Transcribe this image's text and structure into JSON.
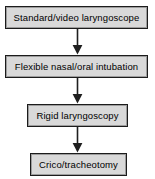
{
  "diagram": {
    "background_color": "#ffffff",
    "box_fill_color": "#d9d9d9",
    "box_border_color": "#1c1c1c",
    "arrow_color": "#1f1f1f",
    "text_color": "#000000",
    "nodes": [
      {
        "id": "node-1",
        "label": "Standard/video laryngoscope",
        "order": "1",
        "x": 5,
        "y": 6,
        "width": 143,
        "height": 23
      },
      {
        "id": "node-2",
        "label": "Flexible nasal/oral intubation",
        "order": "2",
        "x": 5,
        "y": 55,
        "width": 143,
        "height": 23
      },
      {
        "id": "node-3",
        "label": "Rigid laryngoscopy",
        "order": "3",
        "x": 27,
        "y": 104,
        "width": 101,
        "height": 23
      },
      {
        "id": "node-4",
        "label": "Crico/tracheotomy",
        "order": "4",
        "x": 30,
        "y": 153,
        "width": 97,
        "height": 23
      }
    ],
    "connectors": [
      {
        "id": "arrow-1",
        "from": "node-1",
        "to": "node-2",
        "direction": "down",
        "x": 71,
        "y": 29,
        "height": 26
      },
      {
        "id": "arrow-2",
        "from": "node-2",
        "to": "node-3",
        "direction": "down",
        "x": 71,
        "y": 78,
        "height": 26
      },
      {
        "id": "arrow-3",
        "from": "node-3",
        "to": "node-4",
        "direction": "down",
        "x": 71,
        "y": 127,
        "height": 26
      }
    ]
  }
}
